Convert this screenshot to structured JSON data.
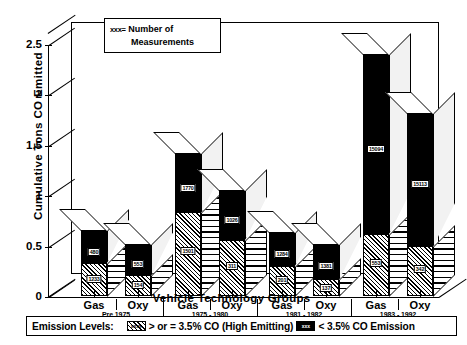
{
  "chart_data": {
    "type": "bar",
    "title": "",
    "xlabel": "Vehicle Technology Groups",
    "ylabel": "Cumulative Tons CO Emitted",
    "ylim": [
      0,
      2.5
    ],
    "ytick_labels": [
      "0",
      "0.5",
      "1",
      "1.5",
      "2",
      "2.5"
    ],
    "ytick_values": [
      0,
      0.5,
      1,
      1.5,
      2,
      2.5
    ],
    "grid": false,
    "stacked": true,
    "legend_position": "bottom",
    "categories": [
      "Gas",
      "Oxy",
      "Gas",
      "Oxy",
      "Gas",
      "Oxy",
      "Gas",
      "Oxy"
    ],
    "group_labels": [
      "Pre 1975",
      "1975 - 1980",
      "1981 - 1982",
      "1983 - 1992"
    ],
    "series": [
      {
        "name": "> or = 3.5% CO (High Emitting)",
        "pattern": "hatch",
        "values": [
          0.33,
          0.21,
          0.83,
          0.56,
          0.3,
          0.17,
          0.62,
          0.5
        ]
      },
      {
        "name": "< 3.5% CO Emission",
        "pattern": "black",
        "values": [
          0.32,
          0.31,
          0.59,
          0.49,
          0.33,
          0.35,
          1.78,
          1.32
        ]
      }
    ],
    "bar_totals": [
      0.65,
      0.52,
      1.42,
      1.05,
      0.63,
      0.52,
      2.4,
      1.82
    ],
    "data_labels": {
      "hatch": [
        "1233",
        "154",
        "1501",
        "311",
        "201",
        "137",
        "553",
        "342"
      ],
      "black": [
        "480",
        "553",
        "1770",
        "1026",
        "1284",
        "1381",
        "15094",
        "15113"
      ]
    },
    "annotation": {
      "marker": "xxx=",
      "line1": "Number  of",
      "line2": "Measurements"
    },
    "bottom_legend": {
      "title": "Emission Levels:",
      "item1_swatch": "xxxx",
      "item1_text": "> or = 3.5% CO (High Emitting)",
      "item2_swatch": "xxx",
      "item2_text": "< 3.5% CO Emission"
    }
  },
  "colors": {
    "ink": "#000000",
    "background": "#ffffff",
    "side_face": "#f2f2f2"
  }
}
